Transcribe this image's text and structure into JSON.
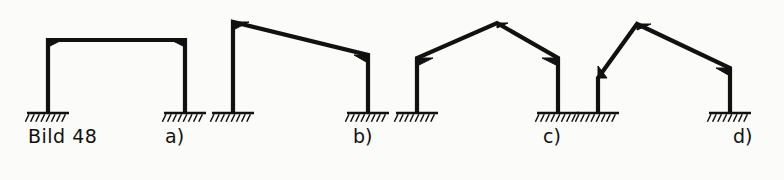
{
  "figure": {
    "title": "Bild 48",
    "title_position": {
      "x": 28,
      "y": 127
    },
    "background_color": "#fbfbf9",
    "line_color": "#111111",
    "ground_baseline_y": 113
  },
  "labels": [
    {
      "id": "a",
      "text": "a)",
      "x": 165,
      "y": 127
    },
    {
      "id": "b",
      "text": "b)",
      "x": 353,
      "y": 127
    },
    {
      "id": "c",
      "text": "c)",
      "x": 543,
      "y": 127
    },
    {
      "id": "d",
      "text": "d)",
      "x": 733,
      "y": 127
    }
  ],
  "frames": [
    {
      "id": "a",
      "name": "rectangular-portal-frame",
      "label": "a)",
      "member_polyline": [
        {
          "x": 48,
          "y": 113
        },
        {
          "x": 48,
          "y": 40
        },
        {
          "x": 185,
          "y": 40
        },
        {
          "x": 185,
          "y": 113
        }
      ],
      "haunches": [
        {
          "corner": "left-eaves",
          "x": 48,
          "y": 40,
          "run": 14,
          "rise": 7
        },
        {
          "corner": "right-eaves",
          "x": 185,
          "y": 40,
          "run": -14,
          "rise": 7
        }
      ],
      "supports": [
        {
          "x": 48,
          "y": 113,
          "half_width": 21,
          "type": "fixed"
        },
        {
          "x": 185,
          "y": 113,
          "half_width": 21,
          "type": "fixed"
        }
      ]
    },
    {
      "id": "b",
      "name": "monopitch-portal-frame",
      "label": "b)",
      "member_polyline": [
        {
          "x": 233,
          "y": 113
        },
        {
          "x": 233,
          "y": 22
        },
        {
          "x": 368,
          "y": 55
        },
        {
          "x": 368,
          "y": 113
        }
      ],
      "haunches": [
        {
          "corner": "left-eaves",
          "x": 233,
          "y": 22,
          "run": 16,
          "rise": 8
        },
        {
          "corner": "right-eaves",
          "x": 368,
          "y": 55,
          "run": -14,
          "rise": 8
        }
      ],
      "supports": [
        {
          "x": 233,
          "y": 113,
          "half_width": 21,
          "type": "fixed"
        },
        {
          "x": 368,
          "y": 113,
          "half_width": 21,
          "type": "fixed"
        }
      ]
    },
    {
      "id": "c",
      "name": "gabled-portal-frame",
      "label": "c)",
      "member_polyline": [
        {
          "x": 417,
          "y": 113
        },
        {
          "x": 417,
          "y": 58
        },
        {
          "x": 497,
          "y": 23
        },
        {
          "x": 558,
          "y": 58
        },
        {
          "x": 558,
          "y": 113
        }
      ],
      "haunches": [
        {
          "corner": "left-eaves",
          "x": 417,
          "y": 58,
          "run": 16,
          "rise": 8
        },
        {
          "corner": "right-eaves",
          "x": 558,
          "y": 58,
          "run": -16,
          "rise": 8
        },
        {
          "corner": "apex",
          "x": 497,
          "y": 23,
          "run": 11,
          "rise": 5
        }
      ],
      "supports": [
        {
          "x": 417,
          "y": 113,
          "half_width": 21,
          "type": "fixed"
        },
        {
          "x": 558,
          "y": 113,
          "half_width": 21,
          "type": "fixed"
        }
      ]
    },
    {
      "id": "d",
      "name": "asymmetric-pitched-portal-frame",
      "label": "d)",
      "member_polyline": [
        {
          "x": 598,
          "y": 113
        },
        {
          "x": 598,
          "y": 78
        },
        {
          "x": 637,
          "y": 24
        },
        {
          "x": 730,
          "y": 68
        },
        {
          "x": 730,
          "y": 113
        }
      ],
      "haunches": [
        {
          "corner": "left-knee",
          "x": 598,
          "y": 78,
          "run": 9,
          "rise": -12
        },
        {
          "corner": "apex",
          "x": 637,
          "y": 24,
          "run": 14,
          "rise": 6
        },
        {
          "corner": "right-eaves",
          "x": 730,
          "y": 68,
          "run": -14,
          "rise": 8
        }
      ],
      "supports": [
        {
          "x": 598,
          "y": 113,
          "half_width": 21,
          "type": "fixed"
        },
        {
          "x": 730,
          "y": 113,
          "half_width": 21,
          "type": "fixed"
        }
      ]
    }
  ],
  "style": {
    "member_stroke_width": 4.2,
    "support_line_width": 2.6,
    "hatch_stroke_width": 1.5,
    "hatch_spacing": 5.2,
    "hatch_length": 7.5,
    "hatch_angle_dx": -3.6
  }
}
